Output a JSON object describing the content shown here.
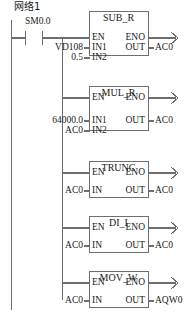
{
  "diagram": {
    "kind": "ladder-logic",
    "network_label": "网络1",
    "rung": {
      "contact": {
        "type": "normally-open-contact",
        "label": "SM0.0"
      }
    },
    "blocks": [
      {
        "name": "SUB_R",
        "title": "SUB_R",
        "en": "EN",
        "eno": "ENO",
        "inputs": [
          {
            "pin": "IN1",
            "operand": "VD108"
          },
          {
            "pin": "IN2",
            "operand": "0.5"
          }
        ],
        "output": {
          "pin": "OUT",
          "operand": "AC0"
        }
      },
      {
        "name": "MUL_R",
        "title": "MUL_R",
        "en": "EN",
        "eno": "ENO",
        "inputs": [
          {
            "pin": "IN1",
            "operand": "64000.0"
          },
          {
            "pin": "IN2",
            "operand": "AC0"
          }
        ],
        "output": {
          "pin": "OUT",
          "operand": "AC0"
        }
      },
      {
        "name": "TRUNC",
        "title": "TRUNC",
        "en": "EN",
        "eno": "ENO",
        "inputs": [
          {
            "pin": "IN",
            "operand": "AC0"
          }
        ],
        "output": {
          "pin": "OUT",
          "operand": "AC0"
        }
      },
      {
        "name": "DI_I",
        "title": "DI_I",
        "en": "EN",
        "eno": "ENO",
        "inputs": [
          {
            "pin": "IN",
            "operand": "AC0"
          }
        ],
        "output": {
          "pin": "OUT",
          "operand": "AC0"
        }
      },
      {
        "name": "MOV_W",
        "title": "MOV_W",
        "en": "EN",
        "eno": "ENO",
        "inputs": [
          {
            "pin": "IN",
            "operand": "AC0"
          }
        ],
        "output": {
          "pin": "OUT",
          "operand": "AQW0"
        }
      }
    ],
    "colors": {
      "line": "#6e6e6e",
      "box_border": "#7a7a7a",
      "text": "#1a1a1a",
      "background": "#ffffff"
    }
  }
}
